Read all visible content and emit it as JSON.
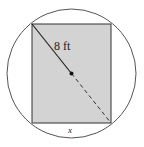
{
  "diagram": {
    "type": "rectangle inscribed in circle",
    "diagonal_label": "8 ft",
    "width_label": "x",
    "colors": {
      "rect_fill": "#d3d3d3",
      "stroke": "#333333",
      "circle_stroke": "#555555"
    }
  }
}
